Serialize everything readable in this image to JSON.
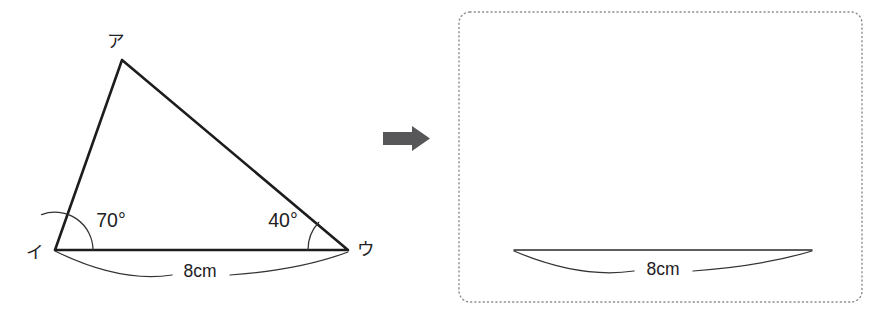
{
  "figure": {
    "colors": {
      "line": "#1d1d1f",
      "thin_line": "#2a2a2c",
      "arrow": "#575759",
      "frame": "#8c8c92",
      "background": "#ffffff",
      "text": "#212124"
    },
    "left_panel": {
      "name": "given-triangle",
      "vertices": [
        {
          "id": "a",
          "label": "ア",
          "x": 122,
          "y": 60,
          "label_x": 116,
          "label_y": 42
        },
        {
          "id": "i",
          "label": "イ",
          "x": 55,
          "y": 250,
          "label_x": 35,
          "label_y": 253
        },
        {
          "id": "u",
          "label": "ウ",
          "x": 348,
          "y": 250,
          "label_x": 366,
          "label_y": 250
        }
      ],
      "angles": [
        {
          "at": "i",
          "label": "70°",
          "value": 70,
          "label_x": 111,
          "label_y": 222,
          "arc_radius": 38
        },
        {
          "at": "u",
          "label": "40°",
          "value": 40,
          "label_x": 283,
          "label_y": 222,
          "arc_radius": 40
        }
      ],
      "measurements": [
        {
          "label": "8cm",
          "value": 8,
          "unit": "cm",
          "between": "i-u",
          "label_x": 200,
          "label_y": 272
        }
      ]
    },
    "transform_arrow": {
      "name": "right-arrow",
      "direction": "right",
      "x": 383,
      "y": 126,
      "width": 47,
      "height": 25
    },
    "right_panel": {
      "name": "answer-workspace",
      "frame": {
        "x": 459,
        "y": 12,
        "width": 403,
        "height": 290,
        "radius": 11,
        "style": "dotted"
      },
      "given_segment": {
        "name": "base-segment",
        "x1": 514,
        "y1": 250,
        "x2": 812,
        "y2": 250
      },
      "measurements": [
        {
          "label": "8cm",
          "value": 8,
          "unit": "cm",
          "label_x": 663,
          "label_y": 270
        }
      ]
    }
  }
}
